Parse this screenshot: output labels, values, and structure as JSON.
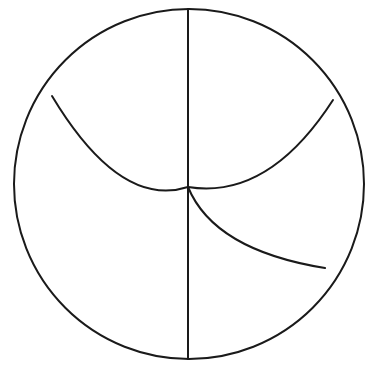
{
  "canvas": {
    "width": 366,
    "height": 372,
    "background_color": "#ffffff",
    "stroke_color": "#1a1a1a",
    "stroke_width": 2
  },
  "watermark": {
    "text": "",
    "color": "#fbfbfc"
  },
  "chart_data": {
    "type": "diagram",
    "title": "",
    "subtitle": "",
    "xlabel": "",
    "ylabel": "",
    "grid": false,
    "legend": null,
    "annotations": [],
    "shapes": [
      {
        "name": "outer-circle",
        "kind": "circle",
        "center_x": 189,
        "center_y": 184,
        "radius": 175,
        "fill": "none",
        "stroke": "#1a1a1a",
        "stroke_width": 2
      },
      {
        "name": "vertical-diameter",
        "kind": "line",
        "x1": 188,
        "y1": 9,
        "x2": 188,
        "y2": 359,
        "stroke": "#1a1a1a",
        "stroke_width": 2
      },
      {
        "name": "upper-arc",
        "kind": "arc",
        "start_x": 52,
        "start_y": 96,
        "junction_x": 188,
        "junction_y": 187,
        "end_x": 333,
        "end_y": 100,
        "concavity": "down",
        "stroke": "#1a1a1a",
        "stroke_width": 2
      },
      {
        "name": "lower-right-arc",
        "kind": "arc",
        "start_x": 188,
        "start_y": 187,
        "end_x": 325,
        "end_y": 268,
        "concavity": "up",
        "stroke": "#1a1a1a",
        "stroke_width": 2
      }
    ],
    "junction_points": [
      {
        "name": "center-junction",
        "x": 188,
        "y": 187
      },
      {
        "name": "left-arc-endpoint",
        "x": 52,
        "y": 96
      },
      {
        "name": "right-arc-endpoint",
        "x": 333,
        "y": 100
      },
      {
        "name": "lower-arc-endpoint",
        "x": 325,
        "y": 268
      },
      {
        "name": "circle-top",
        "x": 188,
        "y": 9
      },
      {
        "name": "circle-bottom",
        "x": 188,
        "y": 359
      }
    ],
    "regions": [
      {
        "name": "upper-lune-region",
        "label": ""
      },
      {
        "name": "left-lower-region",
        "label": ""
      },
      {
        "name": "middle-right-region",
        "label": ""
      },
      {
        "name": "lower-right-region",
        "label": ""
      }
    ]
  }
}
